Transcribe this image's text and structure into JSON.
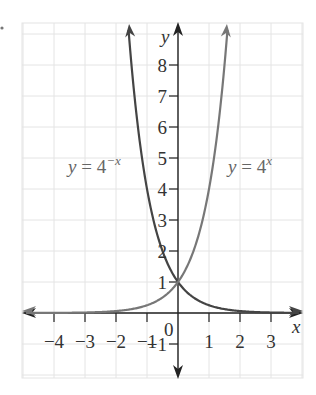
{
  "chart_data": {
    "type": "line",
    "title": "",
    "xlabel": "x",
    "ylabel": "y",
    "xlim": [
      -5,
      4
    ],
    "ylim": [
      -2,
      9
    ],
    "grid": true,
    "x_ticks": [
      -4,
      -3,
      -2,
      -1,
      1,
      2,
      3
    ],
    "x_tick_labels": [
      "−4",
      "−3",
      "−2",
      "−1",
      "1",
      "2",
      "3"
    ],
    "y_ticks": [
      -1,
      1,
      2,
      3,
      4,
      5,
      6,
      7,
      8
    ],
    "y_tick_labels": [
      "−1",
      "1",
      "2",
      "3",
      "4",
      "5",
      "6",
      "7",
      "8"
    ],
    "origin_label": "0",
    "series": [
      {
        "name": "y = 4^-x",
        "label_base": "y = 4",
        "label_exp": "−x",
        "color": "#444444",
        "x": [
          -1.6,
          -1.5,
          -1,
          -0.5,
          0,
          0.5,
          1,
          2,
          3,
          4
        ],
        "values": [
          9.19,
          8,
          4,
          2,
          1,
          0.5,
          0.25,
          0.0625,
          0.0156,
          0.0039
        ]
      },
      {
        "name": "y = 4^x",
        "label_base": "y = 4",
        "label_exp": "x",
        "color": "#777777",
        "x": [
          -5,
          -4,
          -3,
          -2,
          -1,
          -0.5,
          0,
          0.5,
          1,
          1.5,
          1.6
        ],
        "values": [
          0.001,
          0.0039,
          0.0156,
          0.0625,
          0.25,
          0.5,
          1,
          2,
          4,
          8,
          9.19
        ]
      }
    ],
    "annotations": [
      {
        "text": "intersection",
        "x": 0,
        "y": 1
      }
    ]
  }
}
